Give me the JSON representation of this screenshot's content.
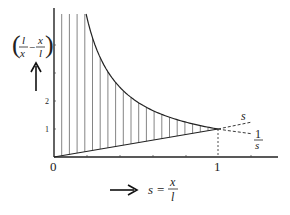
{
  "figure": {
    "y_axis_label": {
      "open_paren": "(",
      "close_paren": ")",
      "frac1_num": "l",
      "frac1_den": "x",
      "minus": "−",
      "frac2_num": "x",
      "frac2_den": "l"
    },
    "x_axis_label": {
      "lhs": "s",
      "equals": "=",
      "frac_num": "x",
      "frac_den": "l"
    },
    "origin_label": "0",
    "x_tick_one_label": "1",
    "y_tick_labels": [
      "1",
      "2"
    ],
    "curve_labels": {
      "line": "s",
      "hyperbola_num": "1",
      "hyperbola_den": "s"
    },
    "colors": {
      "ink": "#222222",
      "hatch": "#555555",
      "background": "#ffffff"
    }
  },
  "chart_data": {
    "type": "line",
    "title": "",
    "xlabel": "s = x/l",
    "ylabel": "(l/x − x/l)",
    "xlim": [
      0,
      1.35
    ],
    "ylim": [
      0,
      5.3
    ],
    "x_ticks": [
      0,
      1
    ],
    "y_ticks": [
      1,
      2
    ],
    "series": [
      {
        "name": "1/s",
        "x": [
          0.2,
          0.3,
          0.4,
          0.5,
          0.6,
          0.7,
          0.8,
          0.9,
          1.0
        ],
        "values": [
          5.0,
          3.33,
          2.5,
          2.0,
          1.67,
          1.43,
          1.25,
          1.11,
          1.0
        ]
      },
      {
        "name": "s",
        "x": [
          0,
          0.2,
          0.4,
          0.6,
          0.8,
          1.0
        ],
        "values": [
          0,
          0.2,
          0.4,
          0.6,
          0.8,
          1.0
        ]
      }
    ],
    "annotations": [
      "Hatched region between 1/s and s for 0 < s < 1",
      "Dashed continuation of s and 1/s beyond s = 1",
      "Dashed vertical drop at s = 1"
    ]
  }
}
